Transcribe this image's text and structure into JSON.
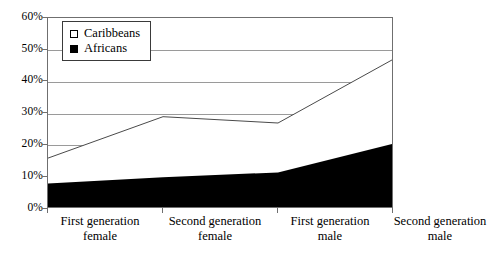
{
  "chart_data": {
    "type": "area",
    "title": "",
    "subtitle": "",
    "xlabel": "",
    "ylabel": "",
    "categories": [
      "First generation female",
      "Second generation female",
      "First generation male",
      "Second generation male"
    ],
    "category_lines": [
      [
        "First generation",
        "female"
      ],
      [
        "Second generation",
        "female"
      ],
      [
        "First generation",
        "male"
      ],
      [
        "Second generation",
        "male"
      ]
    ],
    "series": [
      {
        "name": "Caribbeans",
        "values": [
          16,
          29,
          27,
          47
        ],
        "color": "#ffffff",
        "swatch": "hollow"
      },
      {
        "name": "Africans",
        "values": [
          8,
          10,
          11.5,
          20.5
        ],
        "color": "#000000",
        "swatch": "filled"
      }
    ],
    "stacked": false,
    "ylim": [
      0,
      60
    ],
    "yticks": [
      0,
      10,
      20,
      30,
      40,
      50,
      60
    ],
    "ytick_labels": [
      "0%",
      "10%",
      "20%",
      "30%",
      "40%",
      "50%",
      "60%"
    ],
    "grid": true,
    "grid_axis": "y",
    "legend_position": "top-left",
    "legend_entries": [
      "Caribbeans",
      "Africans"
    ]
  },
  "legend": {
    "items": [
      {
        "label": "Caribbeans",
        "swatch": "hollow-square-icon"
      },
      {
        "label": "Africans",
        "swatch": "filled-square-icon"
      }
    ]
  },
  "axes": {
    "y_labels": [
      "60%",
      "50%",
      "40%",
      "30%",
      "20%",
      "10%",
      "0%"
    ]
  }
}
